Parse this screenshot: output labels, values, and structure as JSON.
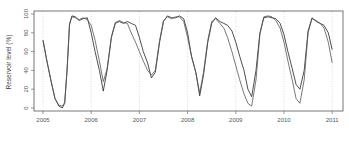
{
  "chart_data": {
    "type": "line",
    "title": "",
    "xlabel": "",
    "ylabel": "Reservoir level (%)",
    "xlim": [
      2004.75,
      2011.2
    ],
    "ylim": [
      -3,
      103
    ],
    "yticks": [
      0,
      20,
      40,
      60,
      80,
      100
    ],
    "xticks": [
      "2005",
      "2006",
      "2007",
      "2008",
      "2009",
      "2010",
      "2011"
    ],
    "grid": "vertical dotted lines at each year",
    "legend": "none",
    "series": [
      {
        "name": "series-1",
        "color": "#222222",
        "x": [
          2005.0,
          2005.08,
          2005.17,
          2005.25,
          2005.33,
          2005.4,
          2005.45,
          2005.5,
          2005.55,
          2005.6,
          2005.67,
          2005.75,
          2005.83,
          2005.92,
          2006.0,
          2006.08,
          2006.17,
          2006.25,
          2006.33,
          2006.42,
          2006.5,
          2006.58,
          2006.67,
          2006.75,
          2006.83,
          2006.92,
          2007.0,
          2007.08,
          2007.17,
          2007.25,
          2007.33,
          2007.42,
          2007.5,
          2007.58,
          2007.67,
          2007.75,
          2007.83,
          2007.92,
          2008.0,
          2008.08,
          2008.17,
          2008.25,
          2008.33,
          2008.42,
          2008.5,
          2008.58,
          2008.67,
          2008.75,
          2008.83,
          2008.92,
          2009.0,
          2009.08,
          2009.17,
          2009.25,
          2009.33,
          2009.42,
          2009.5,
          2009.58,
          2009.67,
          2009.75,
          2009.83,
          2009.92,
          2010.0,
          2010.08,
          2010.17,
          2010.25,
          2010.33,
          2010.42,
          2010.5,
          2010.58,
          2010.67,
          2010.75,
          2010.83,
          2010.92,
          2011.0
        ],
        "values": [
          72,
          50,
          28,
          10,
          2,
          0,
          5,
          40,
          88,
          98,
          97,
          93,
          95,
          96,
          80,
          60,
          40,
          18,
          40,
          75,
          90,
          92,
          90,
          92,
          90,
          88,
          75,
          60,
          48,
          32,
          38,
          70,
          92,
          98,
          96,
          96,
          98,
          95,
          80,
          55,
          38,
          13,
          35,
          70,
          90,
          96,
          92,
          90,
          88,
          82,
          70,
          55,
          40,
          20,
          12,
          40,
          80,
          96,
          97,
          96,
          95,
          90,
          78,
          60,
          42,
          25,
          20,
          40,
          82,
          96,
          92,
          90,
          88,
          80,
          62
        ]
      },
      {
        "name": "series-2",
        "color": "#555555",
        "x": [
          2005.0,
          2005.08,
          2005.17,
          2005.25,
          2005.33,
          2005.4,
          2005.45,
          2005.5,
          2005.55,
          2005.6,
          2005.67,
          2005.75,
          2005.83,
          2005.92,
          2006.0,
          2006.08,
          2006.17,
          2006.25,
          2006.33,
          2006.42,
          2006.5,
          2006.58,
          2006.67,
          2006.75,
          2006.83,
          2006.92,
          2007.0,
          2007.08,
          2007.17,
          2007.25,
          2007.33,
          2007.42,
          2007.5,
          2007.58,
          2007.67,
          2007.75,
          2007.83,
          2007.92,
          2008.0,
          2008.08,
          2008.17,
          2008.25,
          2008.33,
          2008.42,
          2008.5,
          2008.58,
          2008.67,
          2008.75,
          2008.83,
          2008.92,
          2009.0,
          2009.08,
          2009.17,
          2009.25,
          2009.33,
          2009.42,
          2009.5,
          2009.58,
          2009.67,
          2009.75,
          2009.83,
          2009.92,
          2010.0,
          2010.08,
          2010.17,
          2010.25,
          2010.33,
          2010.42,
          2010.5,
          2010.58,
          2010.67,
          2010.75,
          2010.83,
          2010.92,
          2011.0
        ],
        "values": [
          72,
          50,
          28,
          10,
          3,
          2,
          6,
          42,
          90,
          97,
          96,
          94,
          96,
          94,
          88,
          72,
          50,
          28,
          42,
          76,
          91,
          93,
          91,
          90,
          80,
          70,
          60,
          50,
          40,
          35,
          40,
          72,
          93,
          97,
          95,
          97,
          97,
          92,
          75,
          55,
          38,
          16,
          38,
          72,
          92,
          95,
          90,
          85,
          75,
          60,
          45,
          30,
          15,
          5,
          2,
          30,
          78,
          97,
          98,
          97,
          93,
          85,
          70,
          50,
          30,
          10,
          5,
          30,
          80,
          95,
          93,
          90,
          85,
          70,
          48
        ]
      }
    ]
  }
}
